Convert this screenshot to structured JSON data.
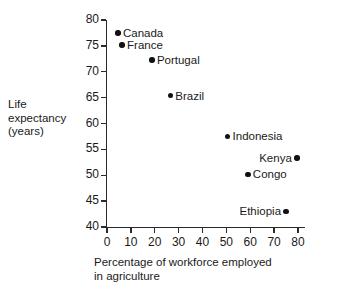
{
  "chart_data": {
    "type": "scatter",
    "title": "",
    "xlabel": "Percentage of workforce employed in agriculture",
    "ylabel": "Life expectancy (years)",
    "xlim": [
      0,
      80
    ],
    "ylim": [
      40,
      80
    ],
    "xticks": [
      0,
      10,
      20,
      30,
      40,
      50,
      60,
      70,
      80
    ],
    "yticks": [
      40,
      45,
      50,
      55,
      60,
      65,
      70,
      75,
      80
    ],
    "grid": false,
    "legend": "none",
    "marker_color": "#111111",
    "axis_color": "#2b2b2b",
    "points": [
      {
        "label": "Canada",
        "x": 4.6,
        "y": 77.5,
        "label_side": "right"
      },
      {
        "label": "France",
        "x": 6.3,
        "y": 75.2,
        "label_side": "right"
      },
      {
        "label": "Portugal",
        "x": 18.8,
        "y": 72.3,
        "label_side": "right"
      },
      {
        "label": "Brazil",
        "x": 26.5,
        "y": 65.4,
        "label_side": "right"
      },
      {
        "label": "Indonesia",
        "x": 50.5,
        "y": 57.5,
        "label_side": "right"
      },
      {
        "label": "Kenya",
        "x": 79.5,
        "y": 53.3,
        "label_side": "left"
      },
      {
        "label": "Congo",
        "x": 59.0,
        "y": 50.2,
        "label_side": "right"
      },
      {
        "label": "Ethiopia",
        "x": 75.0,
        "y": 43.0,
        "label_side": "left"
      }
    ]
  },
  "ylabel_lines": [
    "Life",
    "expectancy",
    "(years)"
  ],
  "xlabel_lines": [
    "Percentage of workforce employed",
    "in agriculture"
  ]
}
